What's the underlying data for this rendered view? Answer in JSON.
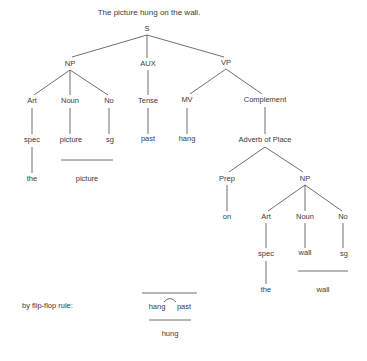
{
  "title": "The picture hung on the wall.",
  "colors": {
    "ink": "#3a3a3a",
    "line": "#4a4a4a",
    "background": "#ffffff"
  },
  "nodes": {
    "S": "S",
    "NP1": "NP",
    "AUX": "AUX",
    "VP": "VP",
    "Art1": "Art",
    "Noun1": "Noun",
    "No1": "No",
    "Tense": "Tense",
    "MV": "MV",
    "Complement": "Complement",
    "spec1": "spec",
    "picture1": "picture",
    "sg1": "sg",
    "past1": "past",
    "hang1": "hang",
    "the1": "the",
    "picture2": "picture",
    "AdvPlace": "Adverb of Place",
    "Prep": "Prep",
    "NP2": "NP",
    "on": "on",
    "Art2": "Art",
    "Noun2": "Noun",
    "No2": "No",
    "spec2": "spec",
    "wall1": "wall",
    "sg2": "sg",
    "the2": "the",
    "wall2": "wall"
  },
  "flipflop": {
    "label": "by flip-flop rule:",
    "left": "hang",
    "right": "past",
    "result": "hung"
  }
}
